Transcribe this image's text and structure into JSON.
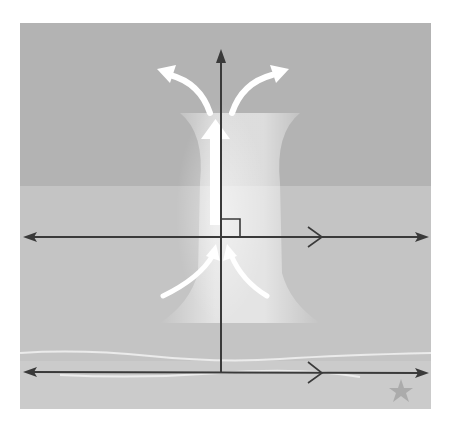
{
  "figure": {
    "colors": {
      "background": "#ffffff",
      "upper_band": "#b3b3b3",
      "lower_band": "#c4c4c4",
      "floor_band": "#cbcbcb",
      "line": "#3a3a3a",
      "flow_arrows": "#ffffff",
      "star": "#9a9a9a"
    },
    "elements": {
      "transversal": {
        "label": "",
        "direction": "up",
        "arrowhead": "top"
      },
      "parallel_line_top": {
        "label": "",
        "parallel_mark": "chevron",
        "arrowheads": "both"
      },
      "parallel_line_bottom": {
        "label": "",
        "parallel_mark": "chevron",
        "arrowheads": "both"
      },
      "right_angle_marker": {
        "label": "",
        "angle_degrees": 90
      },
      "flow_arrows": [
        "up-center",
        "curve-up-left",
        "curve-up-right",
        "inflow-bottom-left",
        "inflow-bottom-right"
      ],
      "star_icon": {
        "label": ""
      }
    }
  }
}
